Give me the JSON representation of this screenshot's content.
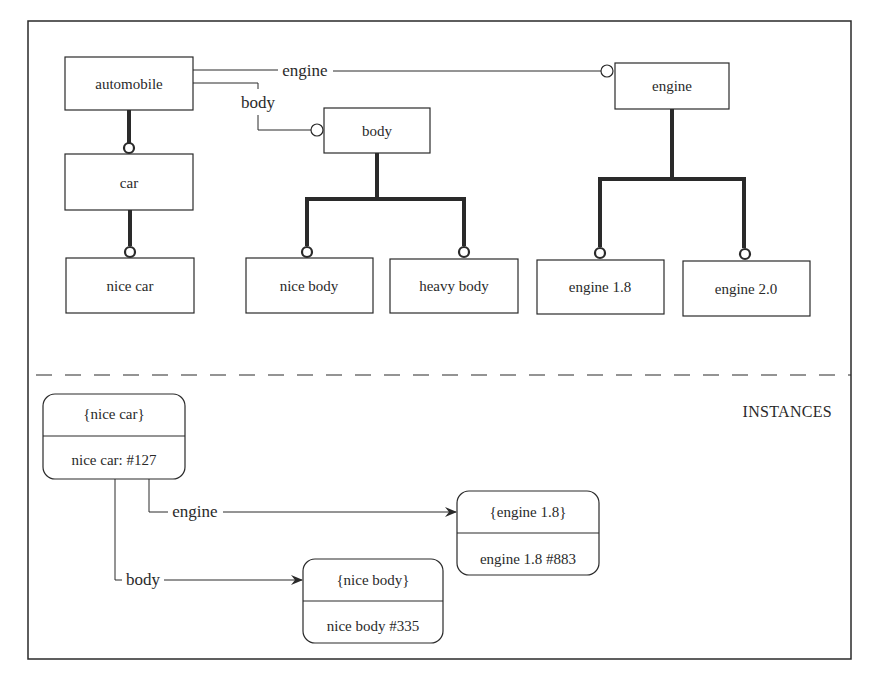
{
  "diagram": {
    "colors": {
      "ink": "#2a2a2a",
      "background": "#ffffff"
    },
    "classes": {
      "automobile": {
        "label": "automobile"
      },
      "car": {
        "label": "car"
      },
      "nice_car": {
        "label": "nice car"
      },
      "body": {
        "label": "body"
      },
      "nice_body": {
        "label": "nice body"
      },
      "heavy_body": {
        "label": "heavy body"
      },
      "engine": {
        "label": "engine"
      },
      "engine_18": {
        "label": "engine 1.8"
      },
      "engine_20": {
        "label": "engine 2.0"
      }
    },
    "associations": {
      "automobile_engine": {
        "label": "engine"
      },
      "automobile_body": {
        "label": "body"
      }
    },
    "section_label": "INSTANCES",
    "instances": {
      "nice_car": {
        "type": "{nice car}",
        "value": "nice car: #127"
      },
      "engine_18": {
        "type": "{engine 1.8}",
        "value": "engine 1.8 #883"
      },
      "nice_body": {
        "type": "{nice body}",
        "value": "nice body #335"
      }
    },
    "links": {
      "engine": {
        "label": "engine"
      },
      "body": {
        "label": "body"
      }
    }
  }
}
